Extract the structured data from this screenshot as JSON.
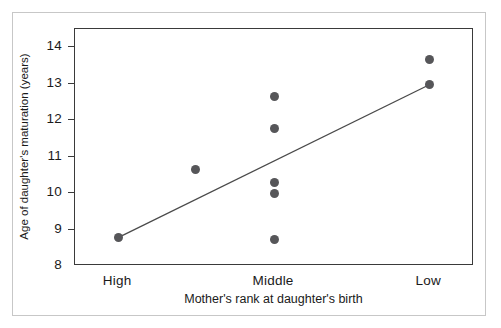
{
  "chart_data": {
    "type": "scatter",
    "title": "",
    "xlabel": "Mother's rank at daughter's birth",
    "ylabel": "Age of daughter's maturation (years)",
    "x_categories": [
      "High",
      "Middle",
      "Low"
    ],
    "ylim": [
      8,
      14.5
    ],
    "yticks": [
      8,
      9,
      10,
      11,
      12,
      13,
      14
    ],
    "ytick_labels": [
      "8",
      "9",
      "10",
      "11",
      "12",
      "13",
      "14"
    ],
    "grid": false,
    "legend": "none",
    "point_color": "#565659",
    "line_color": "#4a4a4a",
    "axis_color": "#3a3a3a",
    "frame_color": "#c7c7c7",
    "points": [
      {
        "x_pos": 0.108,
        "x_label": "High",
        "y": 8.78
      },
      {
        "x_pos": 0.303,
        "x_label": "",
        "y": 10.66
      },
      {
        "x_pos": 0.499,
        "x_label": "Middle",
        "y": 12.65
      },
      {
        "x_pos": 0.499,
        "x_label": "Middle",
        "y": 11.78
      },
      {
        "x_pos": 0.499,
        "x_label": "Middle",
        "y": 10.28
      },
      {
        "x_pos": 0.499,
        "x_label": "Middle",
        "y": 10.0
      },
      {
        "x_pos": 0.499,
        "x_label": "Middle",
        "y": 8.73
      },
      {
        "x_pos": 0.888,
        "x_label": "Low",
        "y": 13.65
      },
      {
        "x_pos": 0.888,
        "x_label": "Low",
        "y": 12.97
      }
    ],
    "trendline": {
      "x_start": 0.108,
      "y_start": 8.78,
      "x_end": 0.888,
      "y_end": 12.97
    }
  }
}
